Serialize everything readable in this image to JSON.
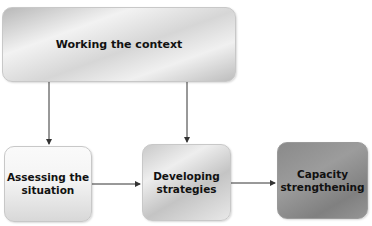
{
  "diagram": {
    "nodes": [
      {
        "id": "working-context",
        "label": "Working the context"
      },
      {
        "id": "assessing",
        "label_line1": "Assessing the",
        "label_line2": "situation"
      },
      {
        "id": "developing",
        "label_line1": "Developing",
        "label_line2": "strategies"
      },
      {
        "id": "capacity",
        "label_line1": "Capacity",
        "label_line2": "strengthening"
      }
    ],
    "edges": [
      {
        "from": "working-context",
        "to": "assessing"
      },
      {
        "from": "working-context",
        "to": "developing"
      },
      {
        "from": "assessing",
        "to": "developing"
      },
      {
        "from": "developing",
        "to": "capacity"
      }
    ],
    "colors": {
      "line": "#333333",
      "text": "#111111",
      "top_box": "#d6d6d6",
      "assess_box": "#f2f2f2",
      "develop_box": "#d2d2d2",
      "capacity_box": "#8e8e8e"
    }
  }
}
